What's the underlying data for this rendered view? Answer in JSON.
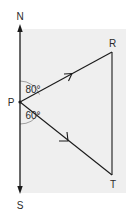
{
  "diagram": {
    "type": "bearings-triangle",
    "background_color": "#efefef",
    "line_color": "#1a1a1a",
    "arc_color": "#8a8a8a",
    "compass": {
      "north_label": "N",
      "south_label": "S"
    },
    "points": {
      "P": {
        "label": "P"
      },
      "R": {
        "label": "R"
      },
      "T": {
        "label": "T"
      }
    },
    "angles": {
      "north_to_PR": "80°",
      "south_to_PT": "60°"
    },
    "segments": [
      {
        "from": "P",
        "to": "R",
        "arrow": true
      },
      {
        "from": "P",
        "to": "T",
        "arrow": true
      },
      {
        "from": "R",
        "to": "T",
        "arrow": false
      }
    ]
  }
}
